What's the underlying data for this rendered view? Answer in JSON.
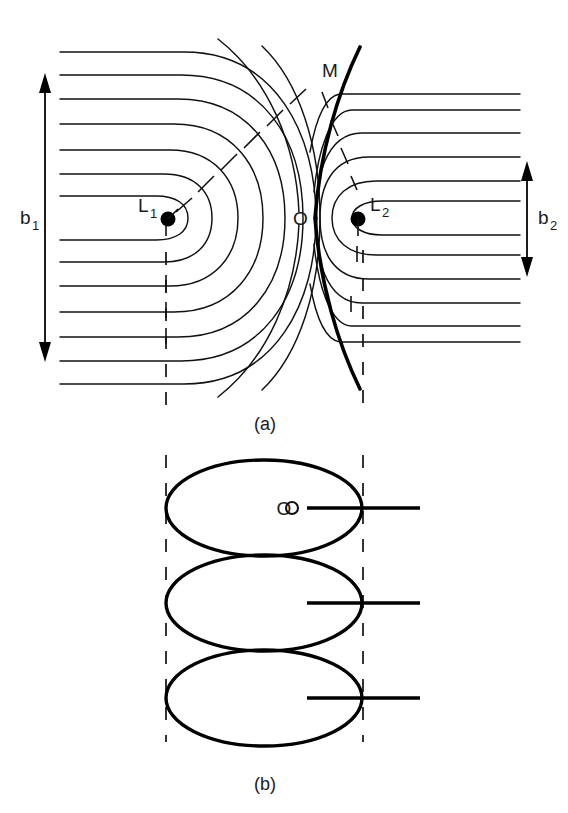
{
  "figure": {
    "title": "",
    "background_color": "#ffffff",
    "line_color": "#111111",
    "width": 568,
    "height": 813
  },
  "panel_a": {
    "caption": "(a)",
    "description": "Equipotential contours of a close binary system with inner Lagrangian point",
    "labels": {
      "left_star": "L",
      "left_star_sub": "1",
      "right_star": "L",
      "right_star_sub": "2",
      "saddle_point": "O",
      "mass_point": "M",
      "left_width": "b",
      "left_width_sub": "1",
      "right_width": "b",
      "right_width_sub": "2"
    },
    "geometry": {
      "L1_x": 166,
      "L1_y": 218,
      "L2_x": 363,
      "L2_y": 218,
      "O_x": 315,
      "O_y": 218,
      "M_x": 330,
      "M_y": 100,
      "contour_count": 13,
      "b1_arrow_top": 78,
      "b1_arrow_bottom": 357,
      "b2_arrow_top": 166,
      "b2_arrow_bottom": 272
    }
  },
  "panel_b": {
    "caption": "(b)",
    "description": "Three tangent ellipses representing the cross sections",
    "labels": {
      "origin": "O"
    },
    "geometry": {
      "ellipse_cx": 264,
      "ellipse_rx": 98,
      "ellipse_ry": 48,
      "ellipse_cy": [
        508,
        603,
        698
      ],
      "dash_left_x": 166,
      "dash_right_x": 363
    }
  }
}
